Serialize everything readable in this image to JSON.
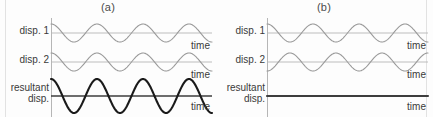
{
  "figure": {
    "caption_a": "(a)",
    "caption_b": "(b)",
    "axis_label": "time",
    "labels": {
      "disp1": "disp. 1",
      "disp2": "disp. 2",
      "resultant": "resultant\ndisp."
    },
    "colors": {
      "background": "#fdfdfd",
      "component_wave": "#9a9a9a",
      "resultant_wave": "#1a1a1a",
      "axis": "#b6b6b6",
      "resultant_axis": "#3d3d3d",
      "text": "#3a3a3a",
      "border": "#e2e2e2"
    }
  },
  "chart_data": [
    {
      "type": "line",
      "title": "(a)",
      "panel": "a",
      "description": "Constructive interference: two in-phase waves sum to a wave of doubled amplitude",
      "xlabel": "time",
      "ylabel": "",
      "grid": false,
      "legend": "none",
      "xlim": [
        0,
        3.5
      ],
      "cycles": 3.5,
      "series": [
        {
          "name": "disp. 1",
          "row": 1,
          "waveform": "cosine",
          "amplitude": 1,
          "phase_deg": 0,
          "cycles": 3.5,
          "color": "#9a9a9a",
          "stroke_width": 1.1,
          "axis_label": "time",
          "values": [
            1.0,
            0.62,
            -0.22,
            -0.9,
            -0.9,
            -0.22,
            0.62,
            1.0,
            0.62,
            -0.22,
            -0.9,
            -0.9,
            -0.22,
            0.62,
            1.0,
            0.62,
            -0.22,
            -0.9,
            -0.9,
            -0.22,
            0.62,
            1.0
          ]
        },
        {
          "name": "disp. 2",
          "row": 2,
          "waveform": "cosine",
          "amplitude": 1,
          "phase_deg": 0,
          "cycles": 3.5,
          "color": "#9a9a9a",
          "stroke_width": 1.1,
          "axis_label": "time",
          "values": [
            1.0,
            0.62,
            -0.22,
            -0.9,
            -0.9,
            -0.22,
            0.62,
            1.0,
            0.62,
            -0.22,
            -0.9,
            -0.9,
            -0.22,
            0.62,
            1.0,
            0.62,
            -0.22,
            -0.9,
            -0.9,
            -0.22,
            0.62,
            1.0
          ]
        },
        {
          "name": "resultant disp.",
          "row": 3,
          "waveform": "cosine",
          "amplitude": 2,
          "phase_deg": 0,
          "cycles": 3.5,
          "color": "#1a1a1a",
          "stroke_width": 2.1,
          "axis_label": "time",
          "values": [
            2.0,
            1.24,
            -0.44,
            -1.8,
            -1.8,
            -0.44,
            1.24,
            2.0,
            1.24,
            -0.44,
            -1.8,
            -1.8,
            -0.44,
            1.24,
            2.0,
            1.24,
            -0.44,
            -1.8,
            -1.8,
            -0.44,
            1.24,
            2.0
          ]
        }
      ]
    },
    {
      "type": "line",
      "title": "(b)",
      "panel": "b",
      "description": "Destructive interference: two antiphase waves cancel to a flat zero line",
      "xlabel": "time",
      "ylabel": "",
      "grid": false,
      "legend": "none",
      "xlim": [
        0,
        3.5
      ],
      "cycles": 3.5,
      "series": [
        {
          "name": "disp. 1",
          "row": 1,
          "waveform": "cosine",
          "amplitude": 1,
          "phase_deg": 0,
          "cycles": 3.5,
          "color": "#9a9a9a",
          "stroke_width": 1.1,
          "axis_label": "time",
          "values": [
            1.0,
            0.62,
            -0.22,
            -0.9,
            -0.9,
            -0.22,
            0.62,
            1.0,
            0.62,
            -0.22,
            -0.9,
            -0.9,
            -0.22,
            0.62,
            1.0,
            0.62,
            -0.22,
            -0.9,
            -0.9,
            -0.22,
            0.62,
            1.0
          ]
        },
        {
          "name": "disp. 2",
          "row": 2,
          "waveform": "cosine",
          "amplitude": 1,
          "phase_deg": 180,
          "cycles": 3.5,
          "color": "#9a9a9a",
          "stroke_width": 1.1,
          "axis_label": "time",
          "values": [
            -1.0,
            -0.62,
            0.22,
            0.9,
            0.9,
            0.22,
            -0.62,
            -1.0,
            -0.62,
            0.22,
            0.9,
            0.9,
            0.22,
            -0.62,
            -1.0,
            -0.62,
            0.22,
            0.9,
            0.9,
            0.22,
            -0.62,
            -1.0
          ]
        },
        {
          "name": "resultant disp.",
          "row": 3,
          "waveform": "flat",
          "amplitude": 0,
          "phase_deg": 0,
          "cycles": 0,
          "color": "#3d3d3d",
          "stroke_width": 2.1,
          "axis_label": "time",
          "values": [
            0,
            0,
            0,
            0,
            0,
            0,
            0,
            0,
            0,
            0,
            0,
            0,
            0,
            0,
            0,
            0,
            0,
            0,
            0,
            0,
            0,
            0
          ]
        }
      ]
    }
  ]
}
